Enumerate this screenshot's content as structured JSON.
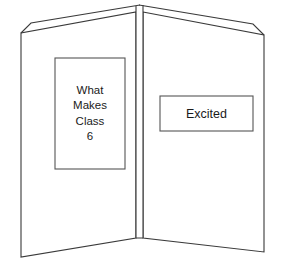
{
  "figure": {
    "name": "tri-fold-presentation-board",
    "background_color": "#ffffff",
    "line_color": "#3a3a3a",
    "box_border_color": "#555555",
    "text_color": "#1a1a1a"
  },
  "left_panel": {
    "name": "left-panel",
    "card": {
      "name": "left-label-card",
      "orientation": "portrait",
      "lines": [
        "What",
        "Makes",
        "Class",
        "6"
      ]
    }
  },
  "spine": {
    "name": "center-spine",
    "label": ""
  },
  "right_panel": {
    "name": "right-panel",
    "card": {
      "name": "right-label-card",
      "orientation": "landscape",
      "lines": [
        "Excited"
      ]
    }
  }
}
